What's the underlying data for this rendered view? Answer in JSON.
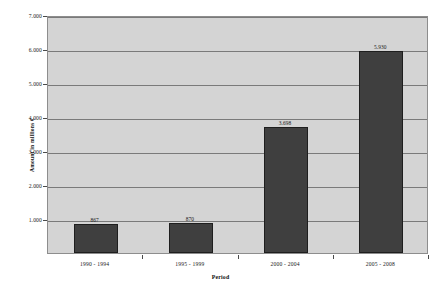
{
  "chart_data": {
    "type": "bar",
    "title": "",
    "subtitle": "",
    "xlabel": "Period",
    "ylabel": "Amount in millions €",
    "categories": [
      "1990 - 1994",
      "1995 - 1999",
      "2000 - 2004",
      "2005 - 2008"
    ],
    "values": [
      867,
      870,
      3698,
      5930
    ],
    "value_labels": [
      "867",
      "870",
      "3.698",
      "5.930"
    ],
    "ylim": [
      0,
      7000
    ],
    "ytick_labels": [
      "1.000",
      "2.000",
      "3.000",
      "4.000",
      "5.000",
      "6.000",
      "7.000"
    ],
    "ytick_values": [
      1000,
      2000,
      3000,
      4000,
      5000,
      6000,
      7000
    ],
    "grid": "horizontal",
    "legend": "none",
    "series": [
      {
        "name": "Amount",
        "values": [
          867,
          870,
          3698,
          5930
        ]
      }
    ]
  },
  "style": {
    "plot_background": "#d4d4d4",
    "canvas_background": "#ffffff",
    "bar_color": "#3f3f3f",
    "bar_border": "#1e1e1e",
    "gridline_color": "#7a7a7a",
    "axis_color": "#8d8d8d",
    "text_color": "#1a1a1a"
  }
}
